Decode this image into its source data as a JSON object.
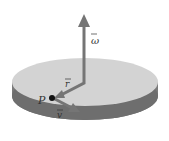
{
  "diagram": {
    "labels": {
      "omega": "ω",
      "r": "r",
      "v": "v",
      "point": "P"
    },
    "colors": {
      "disk_top": "#d3d3d3",
      "disk_side": "#7a7a7a",
      "arrow": "#757575",
      "point": "#111111"
    }
  }
}
